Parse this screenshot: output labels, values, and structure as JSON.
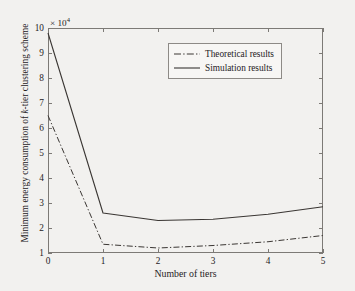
{
  "chart_data": {
    "type": "line",
    "title": "",
    "subtitle": "",
    "xlabel": "Number of tiers",
    "ylabel": "Minimum energy consumption of k-tier clustering scheme",
    "ylabel_prefix": "Minimum energy consumption of ",
    "ylabel_italic": "k",
    "ylabel_suffix": "-tier clustering scheme",
    "y_multiplier": "× 10",
    "y_multiplier_exponent": "4",
    "x": [
      0,
      1,
      2,
      3,
      4,
      5
    ],
    "xlim": [
      0,
      5
    ],
    "ylim": [
      1,
      10
    ],
    "xticks": [
      "0",
      "1",
      "2",
      "3",
      "4",
      "5"
    ],
    "yticks": [
      "1",
      "2",
      "3",
      "4",
      "5",
      "6",
      "7",
      "8",
      "9",
      "10"
    ],
    "grid": false,
    "legend_position": "top-right",
    "series": [
      {
        "name": "Theoretical results",
        "style": "dash-dot",
        "color": "#3a3633",
        "values": [
          6.5,
          1.35,
          1.2,
          1.3,
          1.45,
          1.7
        ]
      },
      {
        "name": "Simulation results",
        "style": "solid",
        "color": "#3a3633",
        "values": [
          9.8,
          2.6,
          2.3,
          2.35,
          2.55,
          2.85
        ]
      }
    ]
  },
  "legend": {
    "entries": [
      {
        "label": "Theoretical results",
        "sample": "dash-dot-line-sample"
      },
      {
        "label": "Simulation results",
        "sample": "solid-line-sample"
      }
    ]
  },
  "colors": {
    "background": "#f2f1ef",
    "axis": "#7d7a76",
    "text": "#25211e",
    "line": "#3a3633"
  }
}
